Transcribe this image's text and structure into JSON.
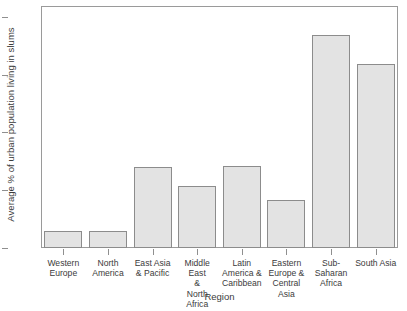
{
  "chart_data": {
    "type": "bar",
    "title": "",
    "subtitle": "",
    "xlabel": "Region",
    "ylabel": "Average % of urban population living in slums",
    "categories": [
      "Western Europe",
      "North America",
      "East Asia & Pacific",
      "Middle East & North Africa",
      "Latin America & Caribbean",
      "Eastern Europe & Central Asia",
      "Sub-Saharan Africa",
      "South Asia"
    ],
    "category_label_lines": [
      [
        "Western",
        "Europe"
      ],
      [
        "North",
        "America"
      ],
      [
        "East Asia",
        "& Pacific"
      ],
      [
        "Middle East",
        "&",
        "North Africa"
      ],
      [
        "Latin",
        "America &",
        "Caribbean"
      ],
      [
        "Eastern",
        "Europe &",
        "Central",
        "Asia"
      ],
      [
        "Sub-",
        "Saharan",
        "Africa"
      ],
      [
        "South Asia"
      ]
    ],
    "values": [
      6,
      6,
      28,
      21.5,
      28.5,
      16.5,
      74,
      64
    ],
    "ylim": [
      0,
      84
    ],
    "yticks": [
      0,
      20,
      40,
      60,
      80
    ],
    "ytick_labels": [
      "0",
      "20",
      "40",
      "60",
      "80"
    ],
    "grid": false,
    "legend": false,
    "legend_position": "none",
    "bar_fill_color": "#e3e3e3",
    "bar_border_color": "#8c8c8c",
    "axis_color": "#9a9a9a",
    "text_color": "#3b3b3b",
    "background_color": "#ffffff"
  }
}
